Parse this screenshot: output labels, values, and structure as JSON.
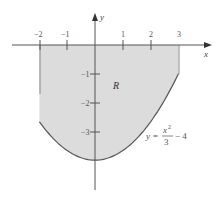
{
  "diagram": {
    "axes": {
      "x_label": "x",
      "y_label": "y",
      "x_ticks": [
        {
          "value": -2,
          "label": "−2"
        },
        {
          "value": -1,
          "label": "−1"
        },
        {
          "value": 1,
          "label": "1"
        },
        {
          "value": 2,
          "label": "2"
        },
        {
          "value": 3,
          "label": "3"
        }
      ],
      "y_ticks": [
        {
          "value": -1,
          "label": "−1"
        },
        {
          "value": -2,
          "label": "−2"
        },
        {
          "value": -3,
          "label": "−3"
        }
      ]
    },
    "region": {
      "label": "R",
      "fill_color": "#dcdcdc",
      "x_min": -2,
      "x_max": 3,
      "upper_boundary": "y = 0",
      "lower_boundary": "y = x^2/3 - 4"
    },
    "curve": {
      "equation_lhs": "y =",
      "equation_numerator": "x",
      "equation_exponent": "2",
      "equation_denominator": "3",
      "equation_tail": "− 4",
      "color": "#555555"
    }
  }
}
